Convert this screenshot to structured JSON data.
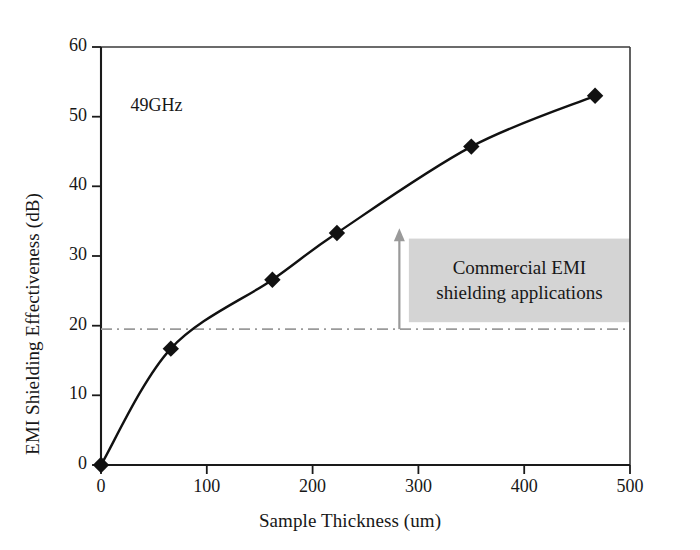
{
  "chart_data": {
    "type": "line",
    "title": "",
    "xlabel": "Sample Thickness (um)",
    "ylabel": "EMI Shielding Effectiveness (dB)",
    "xlim": [
      0,
      500
    ],
    "ylim": [
      0,
      60
    ],
    "xticks": [
      0,
      100,
      200,
      300,
      400,
      500
    ],
    "yticks": [
      0,
      10,
      20,
      30,
      40,
      50,
      60
    ],
    "xtick_labels": [
      "0",
      "100",
      "200",
      "300",
      "400",
      "500"
    ],
    "ytick_labels": [
      "0",
      "10",
      "20",
      "30",
      "40",
      "50",
      "60"
    ],
    "grid": false,
    "legend": null,
    "marker": "diamond",
    "marker_color": "#111111",
    "line_color": "#111111",
    "series": [
      {
        "name": "49GHz",
        "x": [
          0,
          66,
          162,
          223,
          350,
          467
        ],
        "y": [
          0,
          16.7,
          26.6,
          33.3,
          45.7,
          53.0
        ]
      }
    ],
    "annotations": [
      {
        "name": "frequency-label",
        "text": "49GHz",
        "x": 28,
        "y": 51.5
      },
      {
        "name": "threshold-line",
        "type": "hline",
        "value": 19.5,
        "style": "dash-dot",
        "color": "#9a9a9a"
      },
      {
        "name": "commercial-region",
        "text": "Commercial EMI shielding applications",
        "text_line_1": "Commercial EMI",
        "text_line_2": "shielding applications",
        "x_range": [
          291,
          500
        ],
        "y_range": [
          20.5,
          32.5
        ],
        "fill": "#d4d4d4"
      },
      {
        "name": "up-arrow",
        "type": "arrow",
        "x": 282,
        "y_from": 19.5,
        "y_to": 34,
        "color": "#9a9a9a"
      }
    ]
  },
  "axes": {
    "x_title": "Sample Thickness (um)",
    "y_title": "EMI Shielding Effectiveness (dB)"
  },
  "labels": {
    "frequency": "49GHz",
    "commercial_line_1": "Commercial EMI",
    "commercial_line_2": "shielding applications"
  },
  "colors": {
    "axis": "#171717",
    "line": "#111111",
    "marker": "#111111",
    "threshold": "#9a9a9a",
    "region_fill": "#d4d4d4",
    "background": "#ffffff"
  }
}
